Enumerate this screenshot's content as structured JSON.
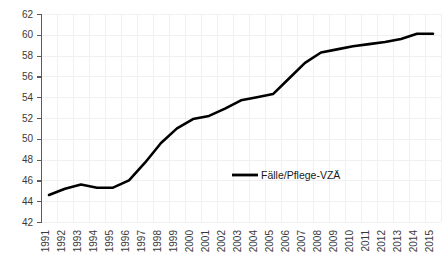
{
  "chart_data": {
    "type": "line",
    "title": "",
    "subtitle": "",
    "xlabel": "",
    "ylabel": "",
    "grid": true,
    "legend_position": "inside-center-right",
    "line_color": "#000000",
    "axis_color": "#5a5a5a",
    "grid_color": "#f0f0f0",
    "background_color": "#ffffff",
    "ylim": [
      42,
      62
    ],
    "ytick_step": 2,
    "yticks": [
      42,
      44,
      46,
      48,
      50,
      52,
      54,
      56,
      58,
      60,
      62
    ],
    "categories": [
      "1991",
      "1992",
      "1993",
      "1994",
      "1995",
      "1996",
      "1997",
      "1998",
      "1999",
      "2000",
      "2001",
      "2002",
      "2003",
      "2004",
      "2005",
      "2006",
      "2007",
      "2008",
      "2009",
      "2010",
      "2011",
      "2012",
      "2013",
      "2014",
      "2015"
    ],
    "series": [
      {
        "name": "Fälle/Pflege-VZÄ",
        "values": [
          44.6,
          45.2,
          45.6,
          45.3,
          45.3,
          46.0,
          47.7,
          49.6,
          51.0,
          51.9,
          52.2,
          52.9,
          53.7,
          54.0,
          54.3,
          55.8,
          57.3,
          58.3,
          58.6,
          58.9,
          59.1,
          59.3,
          59.6,
          60.1,
          60.1
        ]
      }
    ]
  },
  "legend": {
    "entries": [
      {
        "label": "Fälle/Pflege-VZÄ",
        "color": "#000000"
      }
    ]
  }
}
